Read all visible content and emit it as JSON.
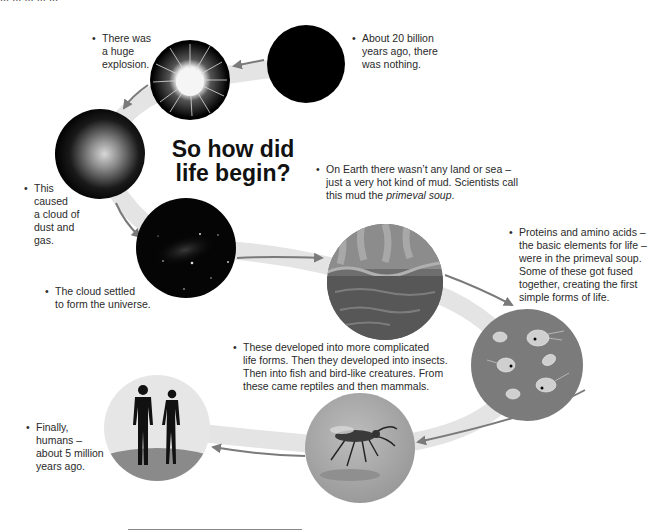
{
  "page": {
    "top_cutoff_text": "... ... ... ... ...",
    "title_line1": "So how did",
    "title_line2": "life begin?",
    "bullet_char": "•"
  },
  "stages": [
    {
      "id": "nothing",
      "icon": "empty-black-sphere-icon",
      "caption_lines": [
        "About 20 billion",
        "years ago, there",
        "was nothing."
      ]
    },
    {
      "id": "explosion",
      "icon": "big-bang-explosion-icon",
      "caption_lines": [
        "There was",
        "a huge",
        "explosion."
      ]
    },
    {
      "id": "dust-cloud",
      "icon": "dust-cloud-icon",
      "caption_lines": [
        "This",
        "caused",
        "a cloud of",
        "dust and",
        "gas."
      ]
    },
    {
      "id": "universe",
      "icon": "starfield-galaxy-icon",
      "caption_lines": [
        "The cloud settled",
        "to form the universe."
      ]
    },
    {
      "id": "primeval-soup",
      "icon": "hot-mud-sea-icon",
      "caption_lines": [
        "On Earth there wasn’t any land or sea –",
        "just a very hot kind of mud. Scientists call",
        "this mud the "
      ],
      "caption_italic": "primeval soup",
      "caption_end": "."
    },
    {
      "id": "simple-life",
      "icon": "microorganisms-icon",
      "caption_lines": [
        "Proteins and amino acids –",
        "the basic elements for life –",
        "were in the primeval soup.",
        "Some of these got fused",
        "together, creating the first",
        "simple forms of life."
      ]
    },
    {
      "id": "complex-life",
      "icon": "insect-icon",
      "caption_lines": [
        "These developed into more complicated",
        "life forms. Then they developed into insects.",
        "Then into fish and bird-like creatures. From",
        "these came reptiles and then mammals."
      ]
    },
    {
      "id": "humans",
      "icon": "human-figures-icon",
      "caption_lines": [
        "Finally,",
        "humans –",
        "about 5 million",
        "years ago."
      ]
    }
  ],
  "colors": {
    "path_band": "#e4e4e4",
    "arrow": "#7a7a7a",
    "space": "#050505",
    "mud": "#6a6a6a",
    "cell_bg": "#7b7b7b",
    "insect_bg": "#a9a9a9",
    "human_bg": "#e6e6e6"
  }
}
